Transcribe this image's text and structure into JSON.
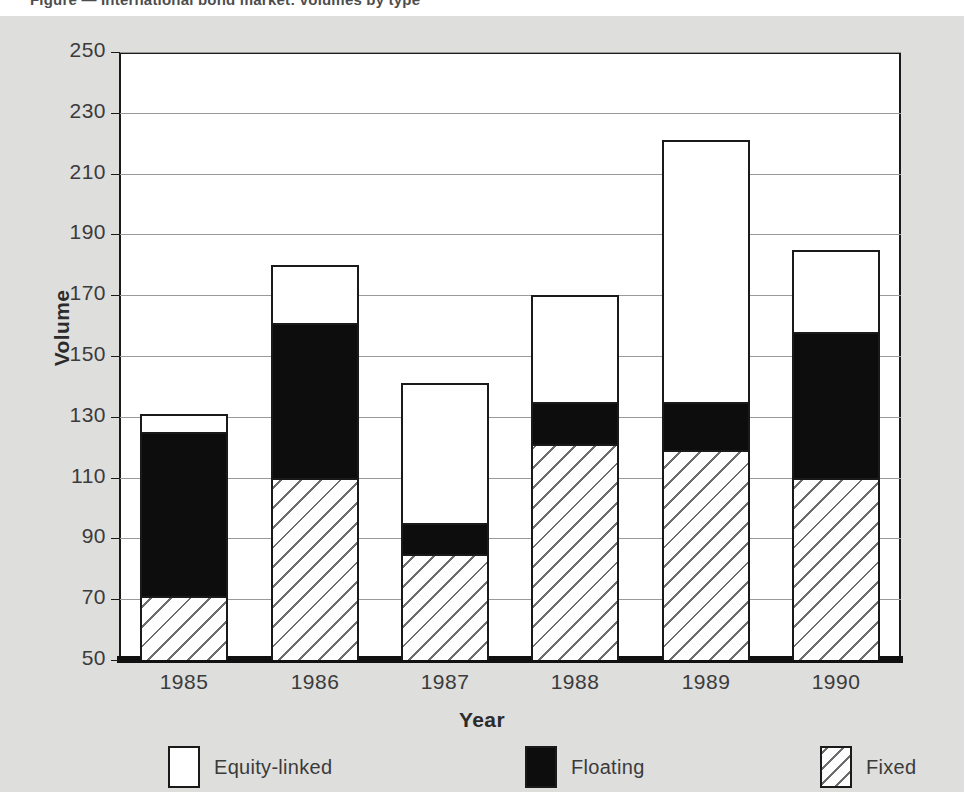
{
  "caption_remnant": "Figure  — International bond market: volumes by type",
  "chart_data": {
    "type": "bar",
    "subtype": "stacked-bar",
    "title": "",
    "xlabel": "Year",
    "ylabel": "Volume",
    "categories": [
      "1985",
      "1986",
      "1987",
      "1988",
      "1989",
      "1990"
    ],
    "ylim": [
      50,
      250
    ],
    "ytick_step": 20,
    "yticks": [
      50,
      70,
      90,
      110,
      130,
      150,
      170,
      190,
      210,
      230,
      250
    ],
    "ytick_labels": [
      "50",
      "70",
      "90",
      "110",
      "130",
      "150",
      "170",
      "190",
      "210",
      "230",
      "250"
    ],
    "grid": true,
    "grid_axis": "y",
    "legend_position": "bottom",
    "stack_order_bottom_to_top": [
      "Fixed",
      "Floating",
      "Equity-linked"
    ],
    "series": [
      {
        "name": "Fixed",
        "key": "fixed",
        "pattern": "diagonal-hatch",
        "color": "#ffffff",
        "cumulative_tops": [
          71,
          110,
          85,
          121,
          119,
          110
        ],
        "values": [
          21,
          60,
          35,
          71,
          69,
          60
        ]
      },
      {
        "name": "Floating",
        "key": "floating",
        "pattern": "solid",
        "color": "#0d0d0d",
        "cumulative_tops": [
          125,
          161,
          95,
          135,
          135,
          158
        ],
        "values": [
          54,
          51,
          10,
          14,
          16,
          48
        ]
      },
      {
        "name": "Equity-linked",
        "key": "equity",
        "pattern": "empty",
        "color": "#ffffff",
        "cumulative_tops": [
          131,
          180,
          141,
          170,
          221,
          185
        ],
        "values": [
          6,
          19,
          46,
          35,
          86,
          27
        ]
      }
    ],
    "bar_totals": [
      131,
      180,
      141,
      170,
      221,
      185
    ],
    "legend": [
      {
        "label": "Equity-linked",
        "swatch": "empty"
      },
      {
        "label": "Floating",
        "swatch": "solid-black"
      },
      {
        "label": "Fixed",
        "swatch": "diagonal-hatch"
      }
    ]
  }
}
